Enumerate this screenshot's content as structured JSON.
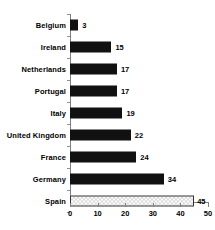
{
  "chart_data": {
    "type": "bar",
    "orientation": "horizontal",
    "title": "",
    "subtitle": "",
    "xlabel": "",
    "ylabel": "",
    "categories": [
      "Belgium",
      "Ireland",
      "Netherlands",
      "Portugal",
      "Italy",
      "United Kingdom",
      "France",
      "Germany",
      "Spain"
    ],
    "values": [
      3,
      15,
      17,
      17,
      19,
      22,
      24,
      34,
      45
    ],
    "value_labels": [
      "3",
      "15",
      "17",
      "17",
      "19",
      "22",
      "24",
      "34",
      "45"
    ],
    "xlim": [
      0,
      50
    ],
    "xticks": [
      0,
      10,
      20,
      30,
      40,
      50
    ],
    "xticklabels": [
      "0",
      "10",
      "20",
      "30",
      "40",
      "50"
    ],
    "grid": false,
    "legend": null,
    "bar_colors": [
      "#111111",
      "#111111",
      "#111111",
      "#111111",
      "#111111",
      "#111111",
      "#111111",
      "#111111",
      "#ffffff"
    ],
    "highlight_category": "Spain",
    "highlight_style": "checkered-light-gray-with-dark-outline",
    "axis_color": "#808080"
  }
}
